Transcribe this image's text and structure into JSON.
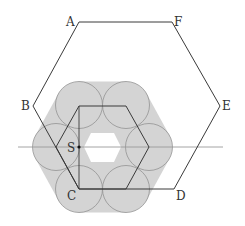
{
  "diagram": {
    "type": "geometry",
    "colors": {
      "background": "#ffffff",
      "fill": "#d4d4d4",
      "circle_stroke": "#8a8a8a",
      "line": "#3a3a3a",
      "axis": "#9a9a9a",
      "hole": "#ffffff"
    },
    "outer_hexagon": {
      "vertices": [
        {
          "label": "A",
          "x": 79,
          "y": 22
        },
        {
          "label": "B",
          "x": 33,
          "y": 106
        },
        {
          "label": "C",
          "x": 79,
          "y": 189
        },
        {
          "label": "D",
          "x": 174,
          "y": 189
        },
        {
          "label": "E",
          "x": 220,
          "y": 106
        },
        {
          "label": "F",
          "x": 172,
          "y": 22
        }
      ]
    },
    "inner_hexagon": {
      "vertices": [
        {
          "x": 56,
          "y": 147
        },
        {
          "x": 79,
          "y": 106
        },
        {
          "x": 126,
          "y": 106
        },
        {
          "x": 149,
          "y": 147
        },
        {
          "x": 126,
          "y": 189
        },
        {
          "x": 79,
          "y": 189
        }
      ]
    },
    "circles": [
      {
        "cx": 56,
        "cy": 147,
        "r": 23.5
      },
      {
        "cx": 79,
        "cy": 105,
        "r": 23.5
      },
      {
        "cx": 126,
        "cy": 105,
        "r": 23.5
      },
      {
        "cx": 149,
        "cy": 147,
        "r": 23.5
      },
      {
        "cx": 126,
        "cy": 189,
        "r": 23.5
      },
      {
        "cx": 79,
        "cy": 189,
        "r": 23.5
      }
    ],
    "hole_hexagon": {
      "points": "84,147 91,133 114,133 121,147 114,162 91,162"
    },
    "vertical_segment": {
      "x": 79,
      "y1": 106,
      "y2": 189
    },
    "horizontal_line": {
      "x1": 18,
      "x2": 223,
      "y": 147
    },
    "point_S": {
      "label": "S",
      "x": 79,
      "y": 147
    },
    "labels": {
      "A": "A",
      "B": "B",
      "C": "C",
      "D": "D",
      "E": "E",
      "F": "F",
      "S": "S"
    }
  }
}
